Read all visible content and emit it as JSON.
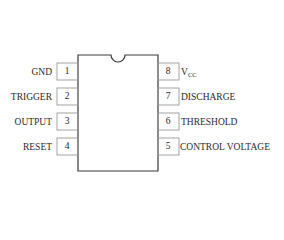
{
  "diagram": {
    "type": "ic-pinout",
    "package": "DIP-8",
    "colors": {
      "line": "#3a3a3a",
      "pin_box": "#9a9a9a",
      "background": "#ffffff"
    },
    "left_pins": [
      {
        "number": "1",
        "label": "GND"
      },
      {
        "number": "2",
        "label": "TRIGGER"
      },
      {
        "number": "3",
        "label": "OUTPUT"
      },
      {
        "number": "4",
        "label": "RESET"
      }
    ],
    "right_pins": [
      {
        "number": "8",
        "label": "V",
        "label_sub": "CC"
      },
      {
        "number": "7",
        "label": "DISCHARGE"
      },
      {
        "number": "6",
        "label": "THRESHOLD"
      },
      {
        "number": "5",
        "label": "CONTROL VOLTAGE"
      }
    ]
  }
}
